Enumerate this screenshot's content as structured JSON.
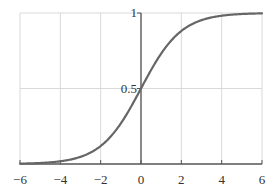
{
  "chart_data": {
    "type": "line",
    "title": "",
    "xlabel": "",
    "ylabel": "",
    "function": "sigmoid: y = 1 / (1 + e^(-x))",
    "xlim": [
      -6,
      6
    ],
    "ylim": [
      0,
      1
    ],
    "grid": true,
    "legend": null,
    "x_ticks": [
      -6,
      -4,
      -2,
      0,
      2,
      4,
      6
    ],
    "x_tick_labels": [
      "−6",
      "−4",
      "−2",
      "0",
      "2",
      "4",
      "6"
    ],
    "y_ticks": [
      0.5,
      1
    ],
    "y_tick_labels": [
      "0.5",
      "1"
    ],
    "y_axis_position": "x=0",
    "series": [
      {
        "name": "sigmoid",
        "color": "#666666",
        "x": [
          -6,
          -5,
          -4,
          -3,
          -2,
          -1.5,
          -1,
          -0.5,
          0,
          0.5,
          1,
          1.5,
          2,
          3,
          4,
          5,
          6
        ],
        "y": [
          0.0025,
          0.0067,
          0.018,
          0.047,
          0.119,
          0.182,
          0.269,
          0.378,
          0.5,
          0.622,
          0.731,
          0.818,
          0.881,
          0.953,
          0.982,
          0.9933,
          0.9975
        ]
      }
    ]
  },
  "colors": {
    "grid": "#d9d9d9",
    "axis": "#555555",
    "curve": "#666666",
    "text": "#333333"
  }
}
